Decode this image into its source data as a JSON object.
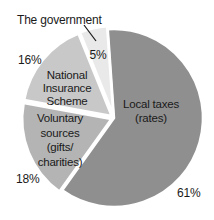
{
  "chart_data": {
    "type": "pie",
    "title": "",
    "legend_position": "none",
    "direction": "clockwise",
    "start_angle_deg": -4,
    "center": [
      114,
      118
    ],
    "radius": 89,
    "explode": [
      0,
      3,
      3,
      3
    ],
    "slices": [
      {
        "label": "Local taxes (rates)",
        "value": 61,
        "pct_label": "61%",
        "color": "#8f8f8f"
      },
      {
        "label": "Voluntary sources (gifts/charities)",
        "value": 18,
        "pct_label": "18%",
        "color": "#b4b4b4"
      },
      {
        "label": "National Insurance Scheme",
        "value": 16,
        "pct_label": "16%",
        "color": "#c8c8c8"
      },
      {
        "label": "The government",
        "value": 5,
        "pct_label": "5%",
        "color": "#e9e9e9"
      }
    ],
    "annotations": "Percentage labels outside the pie for 61%, 18%, 16%; 5% inside its slice; 'The government' slice named via a leader line from text at top-left"
  },
  "labels": {
    "government": "The government",
    "government_pct": "5%",
    "ni_line1": "National",
    "ni_line2": "Insurance",
    "ni_line3": "Scheme",
    "ni_pct": "16%",
    "vol_line1": "Voluntary",
    "vol_line2": "sources",
    "vol_line3": "(gifts/",
    "vol_line4": "charities)",
    "vol_pct": "18%",
    "local_line1": "Local taxes",
    "local_line2": "(rates)",
    "local_pct": "61%"
  },
  "colors": {
    "background": "#ffffff",
    "text": "#1a1a1a",
    "slice_border": "#ffffff",
    "leader_line": "#1a1a1a"
  }
}
